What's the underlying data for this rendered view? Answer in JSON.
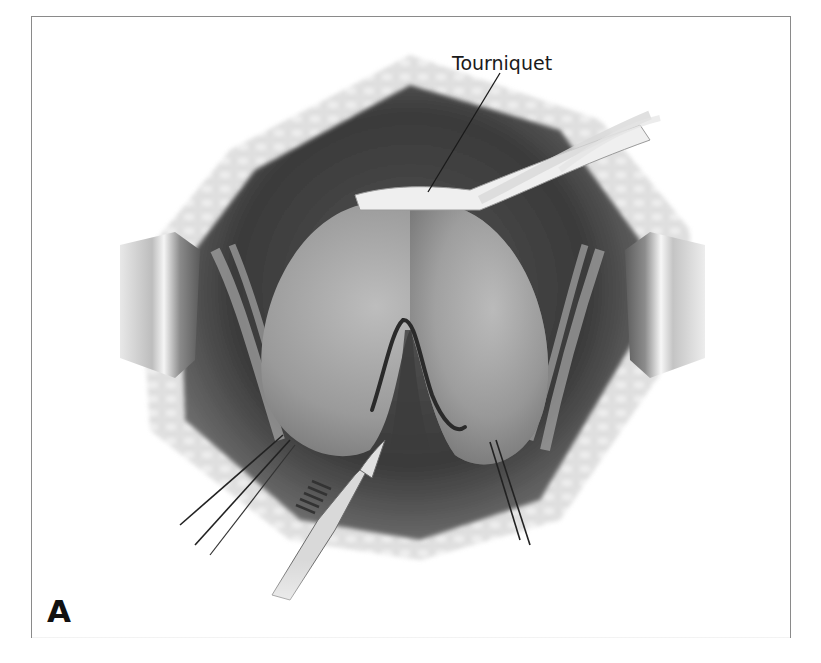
{
  "figure": {
    "panel_label": "A",
    "callouts": [
      {
        "label": "Tourniquet",
        "target": "tourniquet-band"
      }
    ],
    "elements": [
      "retractor-left",
      "retractor-right",
      "tourniquet-band",
      "bilobed-organ",
      "incision-line",
      "scalpel",
      "stay-sutures-left",
      "stay-sutures-right",
      "wound-edge-fat-tissue"
    ]
  },
  "colors": {
    "frame_border": "#8a8a8a",
    "cavity_dark": "#3a3a3a",
    "organ": "#9a9a9a",
    "tissue_light": "#cfcfcf",
    "incision": "#2a2a2a"
  }
}
